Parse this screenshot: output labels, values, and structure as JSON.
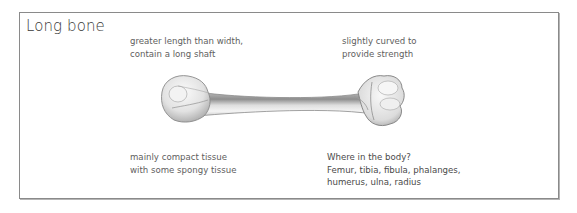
{
  "diagram": {
    "title": "Long bone",
    "illustration": "long-bone (femur/humerus style) illustration",
    "annotations": {
      "top_left": {
        "lines": [
          "greater length than width,",
          "contain a long shaft"
        ]
      },
      "top_right": {
        "lines": [
          "slightly curved to",
          "provide strength"
        ]
      },
      "bottom_left": {
        "lines": [
          "mainly compact tissue",
          "with some spongy tissue"
        ]
      },
      "bottom_right": {
        "lines": [
          "Where in the body?",
          "Femur, tibia, fibula, phalanges,",
          "humerus, ulna, radius"
        ]
      }
    },
    "colors": {
      "border": "#8a8a8a",
      "title_text": "#3a3a3a",
      "note_text": "#5e5e5e",
      "bone_light": "#f2f2f2",
      "bone_shade": "#9a9a9a"
    }
  }
}
